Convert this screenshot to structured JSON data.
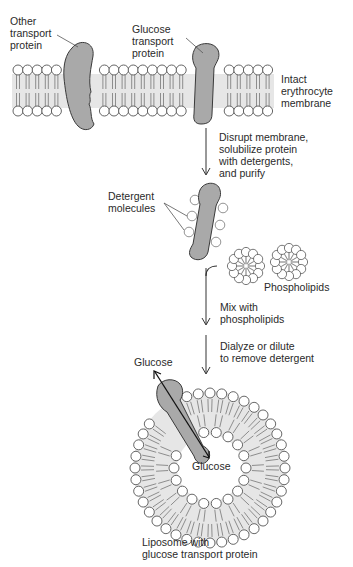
{
  "colors": {
    "protein_fill": "#a9a9a9",
    "protein_stroke": "#3a3a3a",
    "bilayer_fill": "#e6e6e6",
    "headgroup_fill": "#ffffff",
    "line": "#555555",
    "text": "#2a2a2a"
  },
  "labels": {
    "other_transport_protein": "Other\ntransport\nprotein",
    "glucose_transport_protein": "Glucose\ntransport\nprotein",
    "intact_membrane": "Intact\nerythrocyte\nmembrane",
    "step1": "Disrupt membrane,\nsolubilize protein\nwith detergents,\nand purify",
    "detergent_molecules": "Detergent\nmolecules",
    "phospholipids": "Phospholipids",
    "step2": "Mix with\nphospholipids",
    "step3": "Dialyze or dilute\nto remove detergent",
    "glucose_outside": "Glucose",
    "glucose_inside": "Glucose",
    "liposome_caption": "Liposome with\nglucose transport protein"
  }
}
